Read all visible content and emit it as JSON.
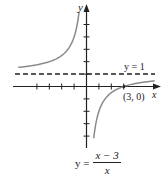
{
  "chart_data": {
    "type": "line",
    "title": "",
    "function": "y = (x - 3) / x",
    "xlabel": "x",
    "ylabel": "y",
    "xlim": [
      -5.6,
      5.6
    ],
    "ylim": [
      -4.9,
      6.5
    ],
    "grid": false,
    "tick_spacing": 1,
    "x_ticks": [
      -4,
      -3,
      -2,
      -1,
      1,
      2,
      3
    ],
    "y_ticks": [
      -4,
      -3,
      -2,
      -1,
      1,
      2,
      3,
      4,
      5
    ],
    "series": [
      {
        "name": "left branch",
        "style": "solid",
        "color": "#8a8a8a",
        "x": [
          -5.5,
          -5,
          -4,
          -3,
          -2,
          -1.5,
          -1,
          -0.75,
          -0.6
        ],
        "y": [
          1.55,
          1.6,
          1.75,
          2,
          2.5,
          3,
          4,
          5,
          6
        ]
      },
      {
        "name": "right branch",
        "style": "solid",
        "color": "#8a8a8a",
        "x": [
          0.58,
          0.75,
          1,
          1.5,
          2,
          3,
          4,
          5,
          5.5
        ],
        "y": [
          -4.2,
          -3,
          -2,
          -1,
          -0.5,
          0,
          0.25,
          0.4,
          0.45
        ]
      },
      {
        "name": "y = 1",
        "style": "dashed",
        "color": "#222222",
        "x": [
          -5.6,
          5.6
        ],
        "y": [
          1,
          1
        ]
      }
    ],
    "annotations": [
      {
        "text": "y = 1",
        "x": 4.2,
        "y": 1.3
      },
      {
        "text": "(3, 0)",
        "x": 3.6,
        "y": -0.8
      },
      {
        "text": "y = (x − 3)/x",
        "x": 0,
        "y": -5.2
      }
    ],
    "points": [
      {
        "x": 3,
        "y": 0,
        "label": "(3, 0)"
      }
    ]
  },
  "labels": {
    "y_axis": "y",
    "x_axis": "x",
    "asymptote": "y = 1",
    "intercept": "(3, 0)",
    "eq_lhs": "y =",
    "eq_num": "x − 3",
    "eq_den": "x"
  },
  "colors": {
    "curve": "#8a8a8a",
    "axis": "#222222",
    "background": "#ffffff"
  }
}
